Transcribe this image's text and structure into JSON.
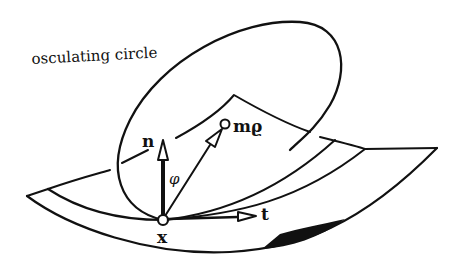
{
  "diagram": {
    "labels": {
      "osculating_circle": "osculating circle",
      "normal": "n",
      "tangent": "t",
      "point": "x",
      "center": "mϱ",
      "angle": "φ"
    },
    "colors": {
      "stroke": "#111111",
      "background": "#ffffff"
    }
  }
}
